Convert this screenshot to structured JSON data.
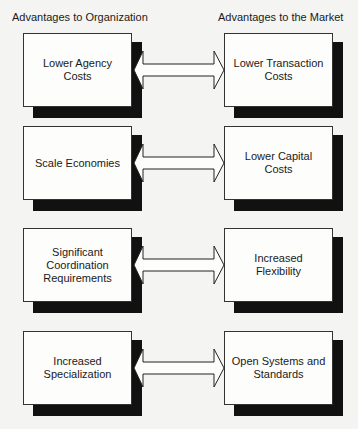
{
  "headers": {
    "left": "Advantages to Organization",
    "right": "Advantages to the Market"
  },
  "rows": [
    {
      "left": "Lower Agency Costs",
      "right": "Lower Transaction Costs",
      "top": 33
    },
    {
      "left": "Scale Economies",
      "right": "Lower Capital Costs",
      "top": 126
    },
    {
      "left": "Significant Coordination Requirements",
      "right": "Increased Flexibility",
      "top": 228
    },
    {
      "left": "Increased Specialization",
      "right": "Open Systems and Standards",
      "top": 331
    }
  ]
}
